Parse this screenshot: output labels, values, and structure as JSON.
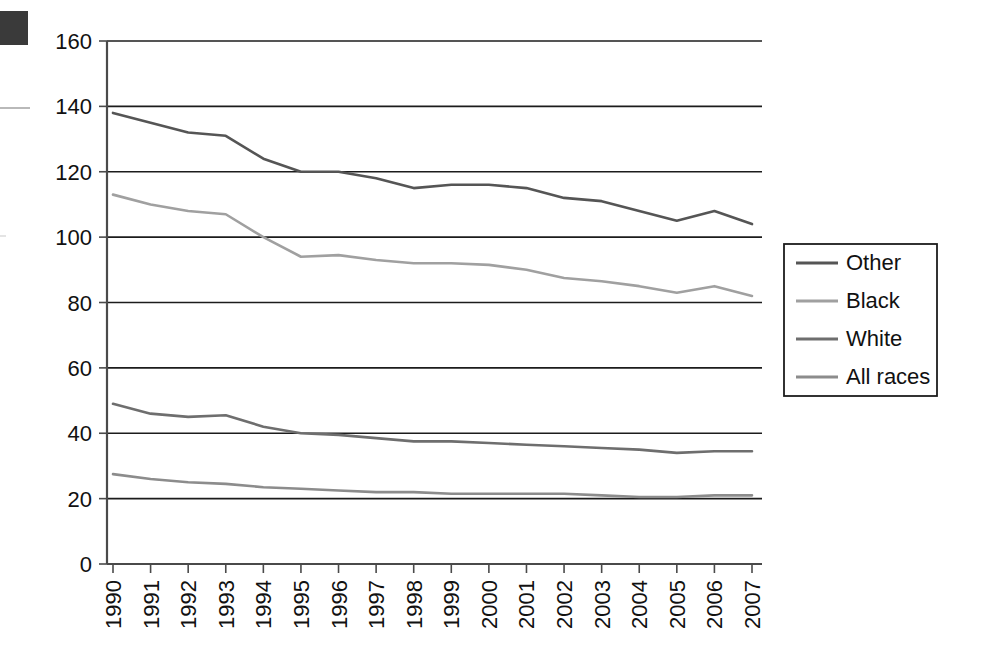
{
  "chart_data": {
    "type": "line",
    "title": "",
    "subtitle": "",
    "xlabel": "",
    "ylabel": "",
    "categories": [
      "1990",
      "1991",
      "1992",
      "1993",
      "1994",
      "1995",
      "1996",
      "1997",
      "1998",
      "1999",
      "2000",
      "2001",
      "2002",
      "2003",
      "2004",
      "2005",
      "2006",
      "2007"
    ],
    "x": [
      1990,
      1991,
      1992,
      1993,
      1994,
      1995,
      1996,
      1997,
      1998,
      1999,
      2000,
      2001,
      2002,
      2003,
      2004,
      2005,
      2006,
      2007
    ],
    "ylim": [
      0,
      160
    ],
    "ytick_values": [
      0,
      20,
      40,
      60,
      80,
      100,
      120,
      140,
      160
    ],
    "ytick_labels": [
      "0",
      "20",
      "40",
      "60",
      "80",
      "100",
      "120",
      "140",
      "160"
    ],
    "grid": true,
    "grid_axis": "y",
    "legend_position": "right",
    "series": [
      {
        "name": "Other",
        "color": "#555555",
        "values": [
          138,
          135,
          132,
          131,
          124,
          120,
          120,
          118,
          115,
          116,
          116,
          115,
          112,
          111,
          108,
          105,
          108,
          104
        ]
      },
      {
        "name": "Black",
        "color": "#a0a0a0",
        "values": [
          113,
          110,
          108,
          107,
          100,
          94,
          94.5,
          93,
          92,
          92,
          91.5,
          90,
          87.5,
          86.5,
          85,
          83,
          85,
          82
        ]
      },
      {
        "name": "White",
        "color": "#6e6e6e",
        "values": [
          49,
          46,
          45,
          45.5,
          42,
          40,
          39.5,
          38.5,
          37.5,
          37.5,
          37,
          36.5,
          36,
          35.5,
          35,
          34,
          34.5,
          34.5
        ]
      },
      {
        "name": "All races",
        "color": "#8c8c8c",
        "values": [
          27.5,
          26,
          25,
          24.5,
          23.5,
          23,
          22.5,
          22,
          22,
          21.5,
          21.5,
          21.5,
          21.5,
          21,
          20.5,
          20.5,
          21,
          21
        ]
      }
    ]
  },
  "legend": {
    "entries": [
      {
        "label": "Other"
      },
      {
        "label": "Black"
      },
      {
        "label": "White"
      },
      {
        "label": "All races"
      }
    ]
  },
  "axes": {
    "y_axis_name": "y-axis",
    "x_axis_name": "x-axis"
  }
}
